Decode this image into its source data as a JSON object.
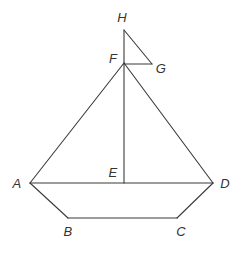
{
  "figure": {
    "background_color": "#ffffff",
    "stroke_color": "#3b3b3b",
    "label_color": "#333333",
    "canvas": {
      "width": 243,
      "height": 256
    },
    "labels": {
      "A": "A",
      "B": "B",
      "C": "C",
      "D": "D",
      "E": "E",
      "F": "F",
      "G": "G",
      "H": "H"
    },
    "label_positions": {
      "A": {
        "x": 17,
        "y": 183
      },
      "B": {
        "x": 68,
        "y": 231
      },
      "C": {
        "x": 181,
        "y": 231
      },
      "D": {
        "x": 225,
        "y": 183
      },
      "E": {
        "x": 113,
        "y": 172
      },
      "F": {
        "x": 113,
        "y": 58
      },
      "G": {
        "x": 161,
        "y": 68
      },
      "H": {
        "x": 122,
        "y": 17
      }
    },
    "points": {
      "A": {
        "x": 30,
        "y": 183
      },
      "B": {
        "x": 68,
        "y": 218
      },
      "C": {
        "x": 177,
        "y": 218
      },
      "D": {
        "x": 213,
        "y": 183
      },
      "E": {
        "x": 124,
        "y": 183
      },
      "F": {
        "x": 124,
        "y": 63
      },
      "G": {
        "x": 152,
        "y": 64
      },
      "H": {
        "x": 124,
        "y": 30
      }
    },
    "segments": [
      {
        "name": "segment-AF",
        "from": "A",
        "to": "F"
      },
      {
        "name": "segment-FD",
        "from": "F",
        "to": "D"
      },
      {
        "name": "segment-AD",
        "from": "A",
        "to": "D"
      },
      {
        "name": "segment-AB",
        "from": "A",
        "to": "B"
      },
      {
        "name": "segment-BC",
        "from": "B",
        "to": "C"
      },
      {
        "name": "segment-CD",
        "from": "C",
        "to": "D"
      },
      {
        "name": "segment-FE",
        "from": "F",
        "to": "E"
      },
      {
        "name": "segment-FH",
        "from": "F",
        "to": "H"
      },
      {
        "name": "segment-HG",
        "from": "H",
        "to": "G"
      },
      {
        "name": "segment-FG",
        "from": "F",
        "to": "G"
      }
    ]
  }
}
